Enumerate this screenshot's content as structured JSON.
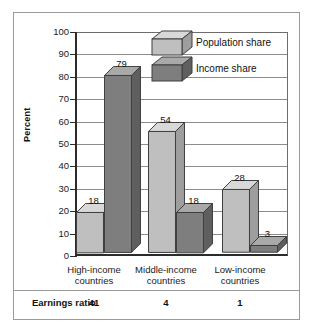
{
  "chart_data": {
    "type": "bar",
    "title": "",
    "xlabel": "",
    "ylabel": "Percent",
    "ylim": [
      0,
      100
    ],
    "ytick_values": [
      0,
      10,
      20,
      30,
      40,
      50,
      60,
      70,
      80,
      90,
      100
    ],
    "ytick_labels": [
      "0",
      "10",
      "20",
      "30",
      "40",
      "50",
      "60",
      "70",
      "80",
      "90",
      "100"
    ],
    "grid": true,
    "legend_position": "top-center",
    "categories": [
      "High-income countries",
      "Middle-income countries",
      "Low-income countries"
    ],
    "category_lines": [
      [
        "High-income",
        "countries"
      ],
      [
        "Middle-income",
        "countries"
      ],
      [
        "Low-income",
        "countries"
      ]
    ],
    "series": [
      {
        "name": "Population share",
        "values": [
          18,
          54,
          28
        ],
        "color": "#bfbfbf"
      },
      {
        "name": "Income share",
        "values": [
          79,
          18,
          3
        ],
        "color": "#7e7e7e"
      }
    ],
    "annotations": {
      "row_label": "Earnings ratio",
      "row_values": [
        "41",
        "4",
        "1"
      ]
    }
  },
  "legend": {
    "items": [
      {
        "label": "Population share",
        "swatch": "light-cube-icon"
      },
      {
        "label": "Income share",
        "swatch": "dark-cube-icon"
      }
    ]
  },
  "axis": {
    "y_label": "Percent",
    "ticks": [
      "100",
      "90",
      "80",
      "70",
      "60",
      "50",
      "40",
      "30",
      "20",
      "10",
      "0"
    ]
  },
  "bar_values": {
    "g1_light": "18",
    "g1_dark": "79",
    "g2_light": "54",
    "g2_dark": "18",
    "g3_light": "28",
    "g3_dark": "3"
  },
  "categories": {
    "c1_line1": "High-income",
    "c1_line2": "countries",
    "c2_line1": "Middle-income",
    "c2_line2": "countries",
    "c3_line1": "Low-income",
    "c3_line2": "countries"
  },
  "ratio": {
    "label": "Earnings ratio",
    "v1": "41",
    "v2": "4",
    "v3": "1"
  },
  "colors": {
    "light_face": "#bfbfbf",
    "light_top": "#d8d8d8",
    "light_side": "#9e9e9e",
    "dark_face": "#7e7e7e",
    "dark_top": "#a9a9a9",
    "dark_side": "#5f5f5f",
    "axis": "#2b2b2b",
    "grid": "#8c8c8c",
    "frame": "#9a9a9a"
  }
}
